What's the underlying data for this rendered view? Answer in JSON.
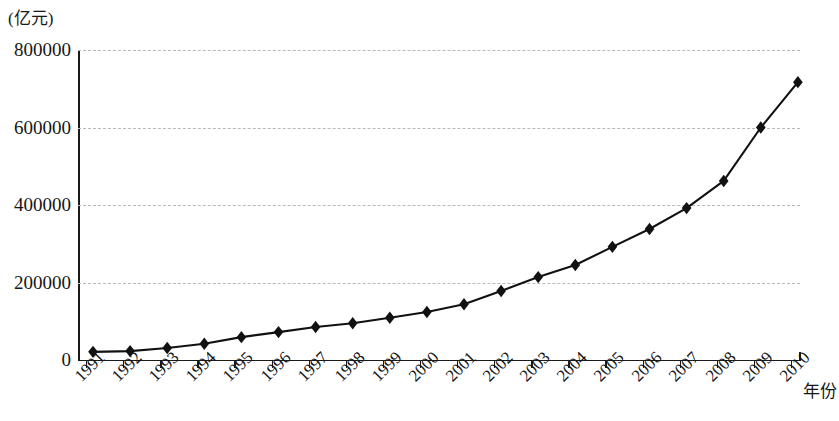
{
  "chart_data": {
    "type": "line",
    "title": "",
    "subtitle": "",
    "xlabel": "年份",
    "ylabel": "(亿元)",
    "y_unit_label": "(亿元)",
    "categories": [
      "1991",
      "1992",
      "1993",
      "1994",
      "1995",
      "1996",
      "1997",
      "1998",
      "1999",
      "2000",
      "2001",
      "2002",
      "2003",
      "2004",
      "2005",
      "2006",
      "2007",
      "2008",
      "2009",
      "2010"
    ],
    "values": [
      21000,
      23000,
      31000,
      42000,
      59000,
      72000,
      85000,
      95000,
      109000,
      124000,
      144000,
      178000,
      214000,
      245000,
      292000,
      338000,
      392000,
      462000,
      600000,
      717000
    ],
    "series": [
      {
        "name": "",
        "values": [
          21000,
          23000,
          31000,
          42000,
          59000,
          72000,
          85000,
          95000,
          109000,
          124000,
          144000,
          178000,
          214000,
          245000,
          292000,
          338000,
          392000,
          462000,
          600000,
          717000
        ]
      }
    ],
    "ylim": [
      0,
      800000
    ],
    "y_ticks": [
      0,
      200000,
      400000,
      600000,
      800000
    ],
    "y_tick_labels": [
      "0",
      "200000",
      "400000",
      "600000",
      "800000"
    ],
    "x_tick_labels": [
      "1991",
      "1992",
      "1993",
      "1994",
      "1995",
      "1996",
      "1997",
      "1998",
      "1999",
      "2000",
      "2001",
      "2002",
      "2003",
      "2004",
      "2005",
      "2006",
      "2007",
      "2008",
      "2009",
      "2010"
    ],
    "grid": true,
    "grid_style": "dashed-horizontal",
    "legend": null,
    "legend_position": "none",
    "marker": "diamond",
    "line_color": "#111111",
    "marker_color": "#111111",
    "grid_color": "#b9b9b9",
    "axis_color": "#1a1a1a",
    "background": "#ffffff"
  }
}
